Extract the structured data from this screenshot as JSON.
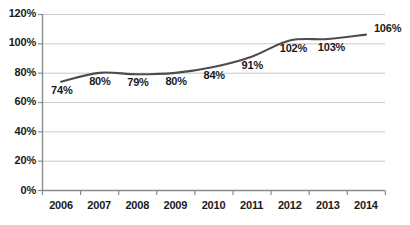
{
  "chart_data": {
    "type": "line",
    "title": "",
    "subtitle": "",
    "xlabel": "",
    "ylabel": "",
    "categories": [
      "2006",
      "2007",
      "2008",
      "2009",
      "2010",
      "2011",
      "2012",
      "2013",
      "2014"
    ],
    "values": [
      74,
      80,
      79,
      80,
      84,
      91,
      102,
      103,
      106
    ],
    "point_labels": [
      "74%",
      "80%",
      "79%",
      "80%",
      "84%",
      "91%",
      "102%",
      "103%",
      "106%"
    ],
    "ylim": [
      0,
      120
    ],
    "ytick_labels": [
      "0%",
      "20%",
      "40%",
      "60%",
      "80%",
      "100%",
      "120%"
    ],
    "ytick_values": [
      0,
      20,
      40,
      60,
      80,
      100,
      120
    ],
    "grid": true,
    "legend": "none",
    "series": [
      {
        "name": "",
        "values": [
          74,
          80,
          79,
          80,
          84,
          91,
          102,
          103,
          106
        ],
        "color": "#4d4d4d",
        "smooth": true,
        "markers": false
      }
    ],
    "colors": {
      "line": "#4d4d4d",
      "gridline": "#c9c9c9",
      "axis": "#808080",
      "text": "#1a1a1a",
      "background": "#ffffff"
    }
  }
}
